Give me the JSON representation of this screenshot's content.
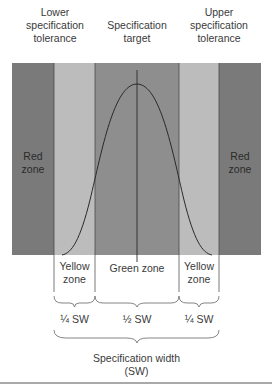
{
  "header": {
    "lower_tolerance": "Lower specification tolerance",
    "lower_tolerance_l1": "Lower",
    "lower_tolerance_l2": "specification",
    "lower_tolerance_l3": "tolerance",
    "target_l1": "Specification",
    "target_l2": "target",
    "upper_tolerance_l1": "Upper",
    "upper_tolerance_l2": "specification",
    "upper_tolerance_l3": "tolerance"
  },
  "zones": {
    "red_left_l1": "Red",
    "red_left_l2": "zone",
    "red_right_l1": "Red",
    "red_right_l2": "zone",
    "yellow_left_l1": "Yellow",
    "yellow_left_l2": "zone",
    "green": "Green zone",
    "yellow_right_l1": "Yellow",
    "yellow_right_l2": "zone"
  },
  "fractions": {
    "left": "¼ SW",
    "center": "½ SW",
    "right": "¼ SW"
  },
  "footer": {
    "width_l1": "Specification width",
    "width_l2": "(SW)"
  },
  "colors": {
    "red_zone": "#7a7a7a",
    "yellow_zone": "#bcbcbc",
    "green_zone": "#8e8e8e",
    "curve": "#2a2a2a"
  }
}
